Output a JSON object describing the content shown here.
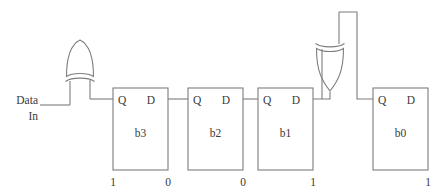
{
  "diagram": {
    "colors": {
      "stroke": "#7d7d7d",
      "text": "#3a3a3a",
      "background": "#ffffff"
    },
    "input": {
      "label_line1": "Data",
      "label_line2": "In",
      "name": "data-in"
    },
    "flipflops": [
      {
        "name": "b3",
        "q_label": "Q",
        "d_label": "D",
        "left_bit": "1",
        "right_bit": "0"
      },
      {
        "name": "b2",
        "q_label": "Q",
        "d_label": "D",
        "left_bit": "",
        "right_bit": "0"
      },
      {
        "name": "b1",
        "q_label": "Q",
        "d_label": "D",
        "left_bit": "",
        "right_bit": "1"
      },
      {
        "name": "b0",
        "q_label": "Q",
        "d_label": "D",
        "left_bit": "",
        "right_bit": "1"
      }
    ],
    "gates": [
      {
        "name": "xor-gate-left",
        "type": "XOR",
        "orientation": "up"
      },
      {
        "name": "xor-gate-right",
        "type": "XOR",
        "orientation": "down"
      }
    ]
  }
}
